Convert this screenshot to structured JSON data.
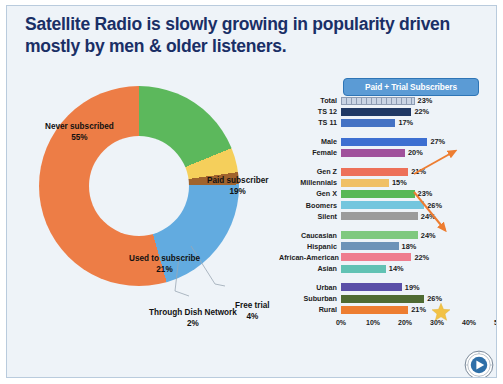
{
  "title": "Satellite Radio is slowly growing in popularity driven mostly by men & older listeners.",
  "header_button": {
    "label": "Paid + Trial Subscribers"
  },
  "colors": {
    "title": "#1a2f66",
    "panel_bg": "#eef3f8",
    "button_bg": "#5b9bd5",
    "arrow": "#ed7d31",
    "star": "#f2c245"
  },
  "donut": {
    "labels": {
      "never": "Never\nsubscribed\n55%",
      "never_name": "Never subscribed",
      "never_value": "55%",
      "paid_name": "Paid subscriber",
      "paid_value": "19%",
      "used_name": "Used to subscribe",
      "used_value": "21%",
      "free_name": "Free trial",
      "free_value": "4%",
      "dish_name": "Through Dish Network",
      "dish_value": "2%"
    }
  },
  "chart_data": {
    "type": "pie",
    "categories": [
      "Paid subscriber",
      "Free trial",
      "Through Dish Network",
      "Used to subscribe",
      "Never subscribed"
    ],
    "values": [
      19,
      4,
      2,
      21,
      55
    ],
    "colors": [
      "#5cb85c",
      "#f5cf5b",
      "#a0632d",
      "#62abe0",
      "#ed7d46"
    ],
    "unit": "%"
  },
  "bar_chart": {
    "type": "bar",
    "orientation": "horizontal",
    "title": "Paid + Trial Subscribers",
    "xlabel": "",
    "ylabel": "",
    "xlim": [
      0,
      50
    ],
    "xticks": [
      "0%",
      "10%",
      "20%",
      "30%",
      "40%",
      "50%"
    ],
    "grid": false,
    "groups": [
      {
        "name": "total",
        "rows": [
          {
            "label": "Total",
            "value": 23,
            "display": "23%",
            "color": "#c9d4e4",
            "pattern": "dotted"
          },
          {
            "label": "TS 12",
            "value": 22,
            "display": "22%",
            "color": "#1f3864",
            "pattern": "none"
          },
          {
            "label": "TS 11",
            "value": 17,
            "display": "17%",
            "color": "#4472c4",
            "pattern": "none"
          }
        ]
      },
      {
        "name": "gender",
        "rows": [
          {
            "label": "Male",
            "value": 27,
            "display": "27%",
            "color": "#3d6fd1",
            "pattern": "none"
          },
          {
            "label": "Female",
            "value": 20,
            "display": "20%",
            "color": "#a0519c",
            "pattern": "none"
          }
        ]
      },
      {
        "name": "generation",
        "rows": [
          {
            "label": "Gen Z",
            "value": 21,
            "display": "21%",
            "color": "#ed7059",
            "pattern": "none"
          },
          {
            "label": "Millennials",
            "value": 15,
            "display": "15%",
            "color": "#f0c065",
            "pattern": "none"
          },
          {
            "label": "Gen X",
            "value": 23,
            "display": "23%",
            "color": "#57b857",
            "pattern": "none"
          },
          {
            "label": "Boomers",
            "value": 26,
            "display": "26%",
            "color": "#74c6de",
            "pattern": "none"
          },
          {
            "label": "Silent",
            "value": 24,
            "display": "24%",
            "color": "#9b9b9b",
            "pattern": "none"
          }
        ]
      },
      {
        "name": "ethnicity",
        "rows": [
          {
            "label": "Caucasian",
            "value": 24,
            "display": "24%",
            "color": "#7fc97f",
            "pattern": "none"
          },
          {
            "label": "Hispanic",
            "value": 18,
            "display": "18%",
            "color": "#6d93b8",
            "pattern": "none"
          },
          {
            "label": "African-American",
            "value": 22,
            "display": "22%",
            "color": "#ef7d8e",
            "pattern": "none"
          },
          {
            "label": "Asian",
            "value": 14,
            "display": "14%",
            "color": "#61c2b4",
            "pattern": "none"
          }
        ]
      },
      {
        "name": "locality",
        "rows": [
          {
            "label": "Urban",
            "value": 19,
            "display": "19%",
            "color": "#5a4fa8",
            "pattern": "none"
          },
          {
            "label": "Suburban",
            "value": 26,
            "display": "26%",
            "color": "#4f6b33",
            "pattern": "none"
          },
          {
            "label": "Rural",
            "value": 21,
            "display": "21%",
            "color": "#ed7d31",
            "pattern": "none"
          }
        ]
      }
    ]
  },
  "annotations": {
    "arrow_up": "up-right-arrow",
    "arrow_down": "down-right-arrow",
    "star": "star-highlight",
    "logo": "play-badge-logo"
  }
}
